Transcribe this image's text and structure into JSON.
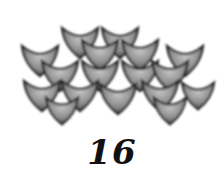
{
  "illustration": {
    "subject": "fish-scale tiles arranged in an arch",
    "icon": "scale-pattern-icon",
    "colors": {
      "scale_light": "#b8b8b8",
      "scale_dark": "#3a3a3a",
      "edge": "#222222",
      "background": "#ffffff"
    }
  },
  "caption": {
    "number": "16"
  }
}
